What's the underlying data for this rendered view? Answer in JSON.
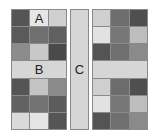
{
  "labels": {
    "a": "A",
    "b": "B",
    "c": "C"
  },
  "left_block": {
    "rows": [
      [
        "#555555",
        "#e6e6e6",
        "#d0d0d0"
      ],
      [
        "#5a5a5a",
        "#707070",
        "#606060"
      ],
      [
        "#8c8c8c",
        "#c8c8c8",
        "#4a4a4a"
      ],
      [
        "#d6d6d6"
      ],
      [
        "#555555",
        "#c4c4c4",
        "#8a8a8a"
      ],
      [
        "#626262",
        "#737373",
        "#5c5c5c"
      ],
      [
        "#dadada",
        "#e4e4e4",
        "#555555"
      ]
    ]
  },
  "column_c": {
    "color": "#d6d6d6"
  },
  "right_block": {
    "rows": [
      [
        "#cfcfcf",
        "#6e6e6e",
        "#4f4f4f"
      ],
      [
        "#e2e2e2",
        "#777777",
        "#bdbdbd"
      ],
      [
        "#545454",
        "#6f6f6f",
        "#8a8a8a"
      ],
      [
        "#d6d6d6"
      ],
      [
        "#cfcfcf",
        "#6c6c6c",
        "#4f4f4f"
      ],
      [
        "#e2e2e2",
        "#777777",
        "#bdbdbd"
      ],
      [
        "#545454",
        "#6f6f6f",
        "#8a8a8a"
      ]
    ]
  }
}
